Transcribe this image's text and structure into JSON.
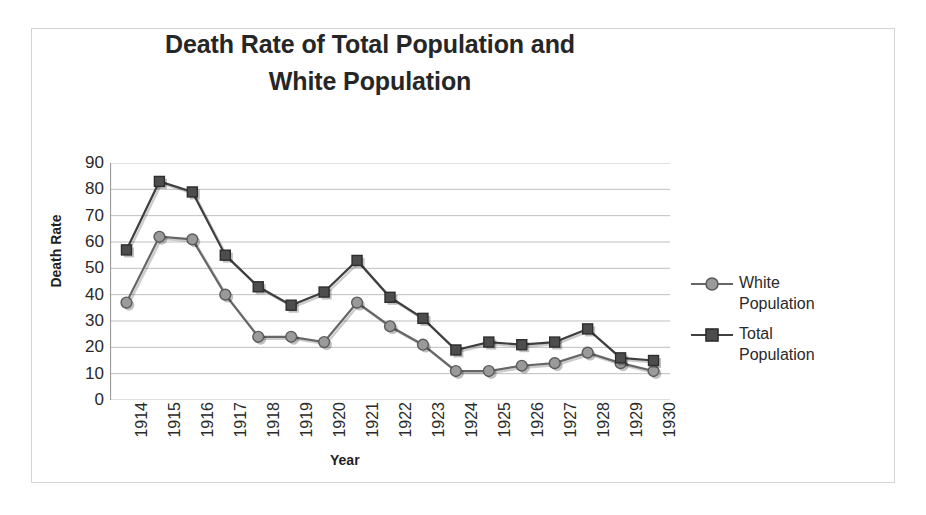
{
  "chart_data": {
    "type": "line",
    "title": "Death Rate of Total Population and White Population",
    "title_line1": "Death Rate of Total Population and",
    "title_line2": "White Population",
    "xlabel": "Year",
    "ylabel": "Death Rate",
    "categories": [
      "1914",
      "1915",
      "1916",
      "1917",
      "1918",
      "1919",
      "1920",
      "1921",
      "1922",
      "1923",
      "1924",
      "1925",
      "1926",
      "1927",
      "1928",
      "1929",
      "1930"
    ],
    "ylim": [
      0,
      90
    ],
    "ytick_labels": [
      "90",
      "80",
      "70",
      "60",
      "50",
      "40",
      "30",
      "20",
      "10",
      "0"
    ],
    "ytick_values": [
      90,
      80,
      70,
      60,
      50,
      40,
      30,
      20,
      10,
      0
    ],
    "grid": true,
    "legend_position": "right",
    "series": [
      {
        "name": "White Population",
        "marker": "circle",
        "color": "#808080",
        "line_color": "#666666",
        "values": [
          37,
          62,
          61,
          40,
          24,
          24,
          22,
          37,
          28,
          21,
          11,
          11,
          13,
          14,
          18,
          14,
          11
        ]
      },
      {
        "name": "Total Population",
        "marker": "square",
        "color": "#4d4d4d",
        "line_color": "#3f3f3f",
        "values": [
          57,
          83,
          79,
          55,
          43,
          36,
          41,
          53,
          39,
          31,
          19,
          22,
          21,
          22,
          27,
          16,
          15
        ]
      }
    ]
  },
  "legend": {
    "entries": [
      {
        "label_line1": "White",
        "label_line2": "Population"
      },
      {
        "label_line1": "Total",
        "label_line2": "Population"
      }
    ]
  }
}
